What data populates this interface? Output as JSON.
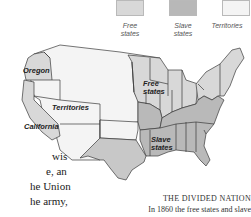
{
  "legend": {
    "items": [
      {
        "label_line1": "Free",
        "label_line2": "states",
        "color": "#d8d8d8"
      },
      {
        "label_line1": "Slave",
        "label_line2": "states",
        "color": "#b8b8b8"
      },
      {
        "label_line1": "Territories",
        "label_line2": "",
        "color": "#f4f4f4"
      }
    ]
  },
  "map": {
    "labels": {
      "oregon": "Oregon",
      "territories": "Territories",
      "california": "California",
      "free_line1": "Free",
      "free_line2": "states",
      "slave_line1": "Slave",
      "slave_line2": "states"
    },
    "colors": {
      "free": "#d8d8d8",
      "slave": "#b9b9b9",
      "territories": "#f4f4f4",
      "border": "#3a3a3a"
    }
  },
  "body_text": {
    "lines": [
      "wis",
      "e, an",
      "he Union",
      "he army,"
    ]
  },
  "caption": {
    "title": "THE DIVIDED NATION",
    "text": "In 1860 the free states and slave"
  }
}
